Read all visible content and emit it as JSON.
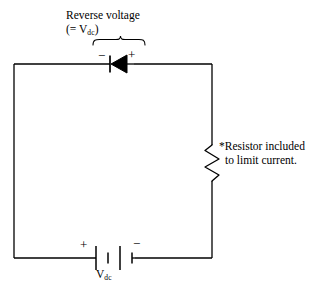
{
  "diagram": {
    "type": "schematic",
    "background_color": "#ffffff",
    "line_color": "#000000",
    "annotations": {
      "reverse_voltage": {
        "line1": "Reverse voltage",
        "line2_prefix": "(= V",
        "line2_subscript": "dc",
        "line2_suffix": ")"
      },
      "resistor_note": {
        "line1": "*Resistor included",
        "line2": "to limit current."
      },
      "source_label": {
        "symbol": "V",
        "subscript": "dc"
      }
    },
    "polarity": {
      "diode_left": "−",
      "diode_right": "+",
      "battery_left": "+",
      "battery_right": "−"
    },
    "components": [
      {
        "name": "diode",
        "orientation": "cathode-left",
        "position": "top-branch"
      },
      {
        "name": "resistor",
        "orientation": "vertical",
        "position": "right-branch"
      },
      {
        "name": "battery",
        "orientation": "horizontal",
        "cells": 2,
        "position": "bottom-branch"
      }
    ]
  }
}
